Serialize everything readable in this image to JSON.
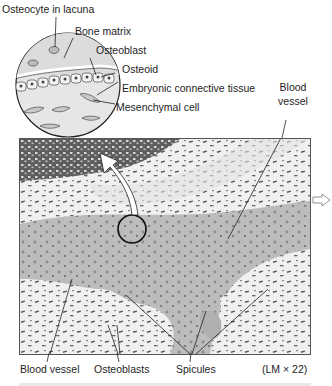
{
  "figure": {
    "magnification": "(LM × 22)",
    "inset_labels": [
      {
        "id": "osteocyte",
        "text": "Osteocyte in lacuna"
      },
      {
        "id": "bone-matrix",
        "text": "Bone matrix"
      },
      {
        "id": "osteoblast",
        "text": "Osteoblast"
      },
      {
        "id": "osteoid",
        "text": "Osteoid"
      },
      {
        "id": "embryonic-ct",
        "text": "Embryonic connective tissue"
      },
      {
        "id": "mesenchymal",
        "text": "Mesenchymal cell"
      }
    ],
    "micrograph_labels": {
      "blood_vessel_top_line1": "Blood",
      "blood_vessel_top_line2": "vessel",
      "blood_vessel_bottom": "Blood vessel",
      "osteoblasts": "Osteoblasts",
      "spicules": "Spicules"
    },
    "colors": {
      "line": "#2a2a2a",
      "spicule": "#b9b9b9",
      "dense_ct": "#6a6a6a",
      "loose_ct": "#ececec",
      "inset_fill": "#e6e6e6"
    }
  }
}
